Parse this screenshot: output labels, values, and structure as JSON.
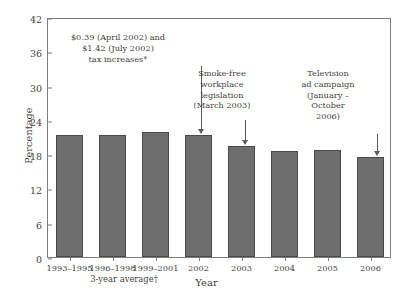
{
  "chart_data": {
    "type": "bar",
    "title": "",
    "xlabel": "Year",
    "ylabel": "Percentage",
    "categories": [
      "1993–1995",
      "1996–1998",
      "1999–2001",
      "2002",
      "2003",
      "2004",
      "2005",
      "2006"
    ],
    "values": [
      21.4,
      21.4,
      21.8,
      21.4,
      19.4,
      18.5,
      18.7,
      17.5
    ],
    "ylim": [
      0,
      42
    ],
    "yticks": [
      0,
      6,
      12,
      18,
      24,
      30,
      36,
      42
    ],
    "grid": false,
    "legend": "none",
    "group_label": "3-year average†",
    "annotations": [
      {
        "id": "tax-increase",
        "lines": [
          "$0.39 (April 2002) and",
          "$1.42 (July 2002)",
          "tax increases*"
        ],
        "target_category": "2002"
      },
      {
        "id": "smoke-free-legislation",
        "lines": [
          "Smoke-free",
          "workplace",
          "legislation",
          "(March 2003)"
        ],
        "target_category": "2003"
      },
      {
        "id": "television-ad-campaign",
        "lines": [
          "Television",
          "ad campaign",
          "(January –",
          "October",
          "2006)"
        ],
        "target_category": "2006"
      }
    ],
    "colors": {
      "bar_fill": "#6e6e6e",
      "bar_edge": "#4a4a4a",
      "axis": "#7d7d7d",
      "text": "#3f3f3f",
      "background": "#ffffff"
    }
  }
}
